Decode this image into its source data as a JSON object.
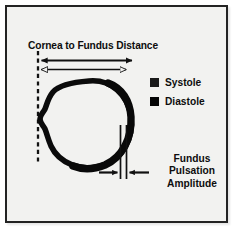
{
  "figure": {
    "background_color": "#f2f2f0",
    "border_color": "#232323",
    "ink_color": "#0d0d0d",
    "title": "Cornea to Fundus Distance",
    "legend": {
      "items": [
        {
          "label": "Systole",
          "swatch_color": "#1a1a1a",
          "marker": "filled-square"
        },
        {
          "label": "Diastole",
          "swatch_color": "#050505",
          "marker": "filled-square"
        }
      ]
    },
    "annotation": {
      "name": "fundus-pulsation-amplitude",
      "lines": [
        "Fundus",
        "Pulsation",
        "Amplitude"
      ]
    },
    "diagram": {
      "subject": "eye-globe-cross-section",
      "reference_line": "dashed-vertical-cornea-plane",
      "measure_arrows": [
        {
          "name": "systole-distance-arrow",
          "style": "filled",
          "length_px": 96
        },
        {
          "name": "diastole-distance-arrow",
          "style": "outlined",
          "length_px": 90
        }
      ],
      "amplitude_markers": {
        "name": "fundus-gap-arrows",
        "count": 2,
        "direction": "inward"
      }
    }
  }
}
